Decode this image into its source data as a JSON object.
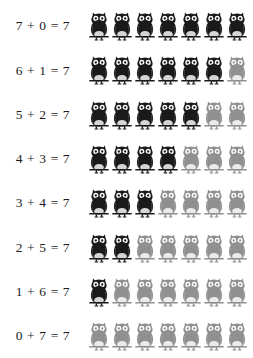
{
  "worksheet": {
    "title": "Decomposing 7 with owl counters",
    "total": 7,
    "colors": {
      "background": "#ffffff",
      "dark_owl": "#1a1a1a",
      "light_owl": "#909090",
      "text": "#1c1c1c"
    },
    "icon_name": "owl-icon",
    "rows": [
      {
        "equation": "7 + 0 = 7",
        "addend_a": 7,
        "addend_b": 0,
        "sum": 7
      },
      {
        "equation": "6 + 1 = 7",
        "addend_a": 6,
        "addend_b": 1,
        "sum": 7
      },
      {
        "equation": "5 + 2 = 7",
        "addend_a": 5,
        "addend_b": 2,
        "sum": 7
      },
      {
        "equation": "4 + 3 = 7",
        "addend_a": 4,
        "addend_b": 3,
        "sum": 7
      },
      {
        "equation": "3 + 4 = 7",
        "addend_a": 3,
        "addend_b": 4,
        "sum": 7
      },
      {
        "equation": "2 + 5 = 7",
        "addend_a": 2,
        "addend_b": 5,
        "sum": 7
      },
      {
        "equation": "1 + 6 = 7",
        "addend_a": 1,
        "addend_b": 6,
        "sum": 7
      },
      {
        "equation": "0 + 7 = 7",
        "addend_a": 0,
        "addend_b": 7,
        "sum": 7
      }
    ]
  }
}
